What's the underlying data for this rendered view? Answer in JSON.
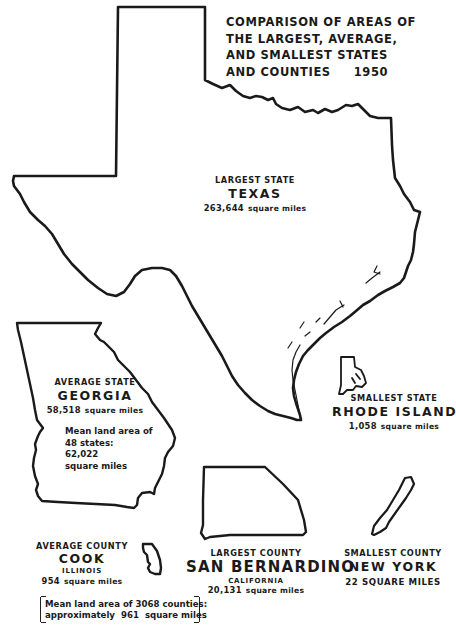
{
  "title": {
    "lines": [
      "COMPARISON OF AREAS OF",
      "THE LARGEST, AVERAGE,",
      "AND SMALLEST STATES",
      "AND COUNTIES     1950"
    ]
  },
  "states": {
    "largest": {
      "caption": "LARGEST STATE",
      "name": "TEXAS",
      "area_value": "263,644",
      "area_unit": "square miles"
    },
    "average": {
      "caption": "AVERAGE STATE",
      "name": "GEORGIA",
      "area_value": "58,518",
      "area_unit": "square miles",
      "note_lines": [
        "Mean land area of",
        "48 states:",
        "62,022",
        "square miles"
      ]
    },
    "smallest": {
      "caption": "SMALLEST STATE",
      "name": "RHODE ISLAND",
      "area_value": "1,058",
      "area_unit": "square miles"
    }
  },
  "counties": {
    "average": {
      "caption": "AVERAGE COUNTY",
      "name": "COOK",
      "state": "ILLINOIS",
      "area_value": "954",
      "area_unit": "square miles",
      "note_lines": [
        "Mean land area of 3068 counties:",
        "approximately  961  square miles"
      ]
    },
    "largest": {
      "caption": "LARGEST COUNTY",
      "name": "SAN BERNARDINO",
      "state": "CALIFORNIA",
      "area_value": "20,131",
      "area_unit": "square miles"
    },
    "smallest": {
      "caption": "SMALLEST COUNTY",
      "name": "NEW YORK",
      "area_text": "22 SQUARE MILES"
    }
  },
  "icons": {
    "texas": "texas-outline",
    "georgia": "georgia-outline",
    "rhode_island": "rhode-island-outline",
    "cook": "cook-county-outline",
    "san_bernardino": "san-bernardino-outline",
    "new_york": "new-york-county-outline"
  },
  "colors": {
    "ink": "#1a1a1a",
    "paper": "#ffffff"
  }
}
